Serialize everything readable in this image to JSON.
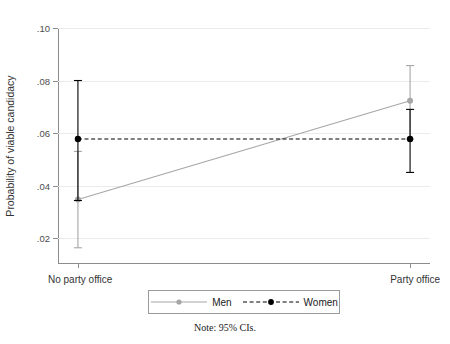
{
  "chart_data": {
    "type": "line",
    "title": "",
    "xlabel": "",
    "ylabel": "Probability of viable candidacy",
    "categories": [
      "No party office",
      "Party office"
    ],
    "x": [
      0,
      1
    ],
    "xlim": [
      -0.06,
      1.06
    ],
    "ylim": [
      0.0105,
      0.1
    ],
    "yticks": [
      0.02,
      0.04,
      0.06,
      0.08,
      0.1
    ],
    "ytick_labels": [
      ".02",
      ".04",
      ".06",
      ".08",
      ".10"
    ],
    "grid": true,
    "grid_axis": "y",
    "legend_position": "bottom-center",
    "note": "Note: 95% CIs.",
    "series": [
      {
        "name": "Men",
        "color": "#a6a6a6",
        "linestyle": "solid",
        "marker": "circle",
        "values": [
          0.0347,
          0.0723
        ],
        "ci_low": [
          0.0163,
          0.0577
        ],
        "ci_high": [
          0.053,
          0.0857
        ]
      },
      {
        "name": "Women",
        "color": "#000000",
        "linestyle": "dashed",
        "marker": "circle",
        "values": [
          0.0577,
          0.0577
        ],
        "ci_low": [
          0.0343,
          0.045
        ],
        "ci_high": [
          0.08,
          0.069
        ]
      }
    ]
  },
  "legend": {
    "items": [
      {
        "label": "Men",
        "color": "#a6a6a6",
        "linestyle": "solid"
      },
      {
        "label": "Women",
        "color": "#000000",
        "linestyle": "dashed"
      }
    ]
  },
  "note": {
    "text": "Note: 95% CIs."
  },
  "colors": {
    "men": "#a6a6a6",
    "women": "#000000",
    "grid": "#ebebeb",
    "axis": "#8c8c8c",
    "text": "#333333"
  }
}
